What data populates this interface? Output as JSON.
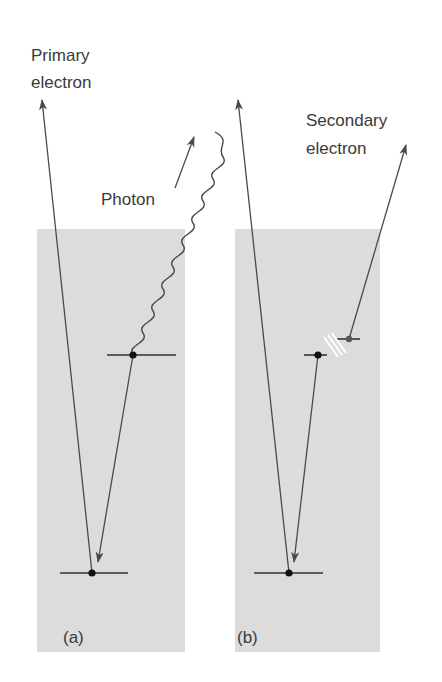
{
  "labels": {
    "primary_line1": "Primary",
    "primary_line2": "electron",
    "photon": "Photon",
    "secondary_line1": "Secondary",
    "secondary_line2": "electron",
    "panel_a": "(a)",
    "panel_b": "(b)"
  },
  "colors": {
    "panel_fill": "#dcdcdc",
    "line": "#4a4a4a",
    "dot": "#111111",
    "text": "#3a3a3a"
  },
  "panels": [
    {
      "id": "a",
      "caption": "(a)",
      "process": "X-ray photon emission"
    },
    {
      "id": "b",
      "caption": "(b)",
      "process": "Secondary electron emission"
    }
  ]
}
